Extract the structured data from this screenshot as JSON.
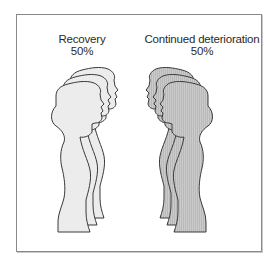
{
  "diagram": {
    "groups": [
      {
        "id": "recovery",
        "title": "Recovery",
        "percent": "50%",
        "fill": "#ececec",
        "pattern": "solid",
        "figure_count": 3,
        "facing": "right"
      },
      {
        "id": "continued-deterioration",
        "title": "Continued deterioration",
        "percent": "50%",
        "fill": "#c6c6c6",
        "pattern": "vertical-hatch",
        "figure_count": 3,
        "facing": "left"
      }
    ],
    "stroke": "#3a3a3a",
    "border_color": "#8a8a8a"
  }
}
